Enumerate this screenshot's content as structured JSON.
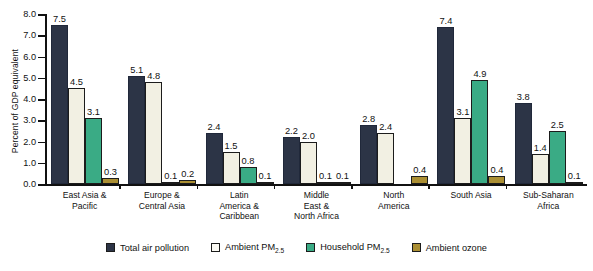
{
  "chart_data": {
    "type": "bar",
    "title": "",
    "subtitle": "",
    "xlabel": "",
    "ylabel": "Percent of GDP equivalent",
    "ylim": [
      0.0,
      8.0
    ],
    "ytick_step": 1.0,
    "ytick_labels": [
      "8.0",
      "7.0",
      "6.0",
      "5.0",
      "4.0",
      "3.0",
      "2.0",
      "1.0",
      "0.0"
    ],
    "grid": false,
    "legend_position": "bottom",
    "categories": [
      "East Asia & Pacific",
      "Europe & Central Asia",
      "Latin America & Caribbean",
      "Middle East & North Africa",
      "North America",
      "South Asia",
      "Sub-Saharan Africa"
    ],
    "category_lines": [
      [
        "East Asia &",
        "Pacific"
      ],
      [
        "Europe &",
        "Central Asia"
      ],
      [
        "Latin",
        "America &",
        "Caribbean"
      ],
      [
        "Middle",
        "East &",
        "North Africa"
      ],
      [
        "North",
        "America"
      ],
      [
        "South Asia"
      ],
      [
        "Sub-Saharan",
        "Africa"
      ]
    ],
    "series": [
      {
        "name": "Total air pollution",
        "color": "#2c3446",
        "values": [
          7.5,
          5.1,
          2.4,
          2.2,
          2.8,
          7.4,
          3.8
        ],
        "labels": [
          "7.5",
          "5.1",
          "2.4",
          "2.2",
          "2.8",
          "7.4",
          "3.8"
        ]
      },
      {
        "name": "Ambient PM2.5",
        "color": "#f2f0e3",
        "values": [
          4.5,
          4.8,
          1.5,
          2.0,
          2.4,
          3.1,
          1.4
        ],
        "labels": [
          "4.5",
          "4.8",
          "1.5",
          "2.0",
          "2.4",
          "3.1",
          "1.4"
        ]
      },
      {
        "name": "Household PM2.5",
        "color": "#3aab85",
        "values": [
          3.1,
          0.1,
          0.8,
          0.1,
          0.0,
          4.9,
          2.5
        ],
        "labels": [
          "3.1",
          "0.1",
          "0.8",
          "0.1",
          "",
          "4.9",
          "2.5"
        ]
      },
      {
        "name": "Ambient ozone",
        "color": "#ab8f33",
        "values": [
          0.3,
          0.2,
          0.1,
          0.1,
          0.4,
          0.4,
          0.1
        ],
        "labels": [
          "0.3",
          "0.2",
          "0.1",
          "0.1",
          "0.4",
          "0.4",
          "0.1"
        ]
      }
    ]
  },
  "legend": {
    "items": [
      {
        "label_main": "Total air pollution",
        "label_sub": "",
        "swatch": "s0"
      },
      {
        "label_main": "Ambient PM",
        "label_sub": "2.5",
        "swatch": "s1"
      },
      {
        "label_main": "Household PM",
        "label_sub": "2.5",
        "swatch": "s2"
      },
      {
        "label_main": "Ambient ozone",
        "label_sub": "",
        "swatch": "s3"
      }
    ]
  },
  "colors": {
    "total_air_pollution": "#2c3446",
    "ambient_pm25": "#f2f0e3",
    "household_pm25": "#3aab85",
    "ambient_ozone": "#ab8f33",
    "axis": "#111111",
    "background": "#ffffff"
  }
}
